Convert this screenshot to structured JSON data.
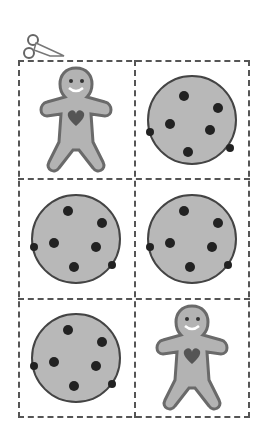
{
  "sheet": {
    "title": "Cut-out cookie cards",
    "colors": {
      "cookie": "#b8b8b8",
      "chip": "#222222",
      "gingerbread": "#b3b3b3",
      "gingerbread_outline": "#6a6a6a",
      "heart": "#555555",
      "cut_line": "#555555"
    },
    "scissors_icon": "scissors-icon",
    "cells": [
      {
        "item": "gingerbread-man"
      },
      {
        "item": "chocolate-chip-cookie"
      },
      {
        "item": "chocolate-chip-cookie"
      },
      {
        "item": "chocolate-chip-cookie"
      },
      {
        "item": "chocolate-chip-cookie"
      },
      {
        "item": "gingerbread-man"
      }
    ]
  }
}
